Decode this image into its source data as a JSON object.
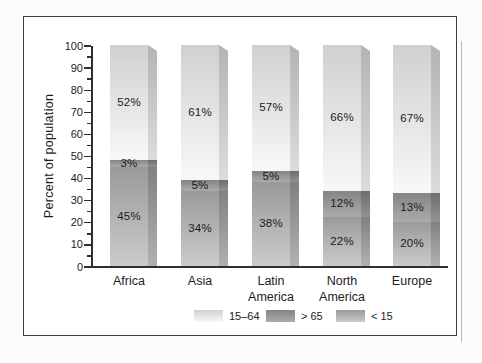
{
  "chart_data": {
    "type": "bar",
    "stacked": true,
    "title": "",
    "xlabel": "",
    "ylabel": "Percent of population",
    "ylim": [
      0,
      100
    ],
    "yticks": [
      0,
      10,
      20,
      30,
      40,
      50,
      60,
      70,
      80,
      90,
      100
    ],
    "ytick_minor_interval": 5,
    "grid": false,
    "categories": [
      "Africa",
      "Asia",
      "Latin America",
      "North America",
      "Europe"
    ],
    "series": [
      {
        "key": "lt15",
        "name": "< 15",
        "values": [
          45,
          34,
          38,
          22,
          20
        ],
        "face_colors": [
          "#9a9a9a",
          "#cbcbcb"
        ],
        "side_colors": [
          "#818181",
          "#b1b1b1"
        ]
      },
      {
        "key": "gt65",
        "name": "> 65",
        "values": [
          3,
          5,
          5,
          12,
          13
        ],
        "face_colors": [
          "#848484",
          "#ababab"
        ],
        "side_colors": [
          "#6d6d6d",
          "#939393"
        ]
      },
      {
        "key": "s1564",
        "name": "15–64",
        "values": [
          52,
          61,
          57,
          66,
          67
        ],
        "face_colors": [
          "#d0d0d0",
          "#f8f8f8"
        ],
        "side_colors": [
          "#b3b3b3",
          "#dcdcdc"
        ]
      }
    ],
    "stack_order": [
      "lt15",
      "gt65",
      "s1564"
    ],
    "value_label_format": "{v}%",
    "legend": {
      "position": "bottom",
      "items": [
        {
          "series_key": "s1564",
          "label": "15–64"
        },
        {
          "series_key": "gt65",
          "label": "> 65"
        },
        {
          "series_key": "lt15",
          "label": "< 15"
        }
      ]
    },
    "colors": {
      "axis": "#2f2f2f",
      "text": "#1c1c1c",
      "frame_border": "#3d3d3d",
      "background": "#ffffff",
      "page_background": "#fcfcfc"
    }
  }
}
